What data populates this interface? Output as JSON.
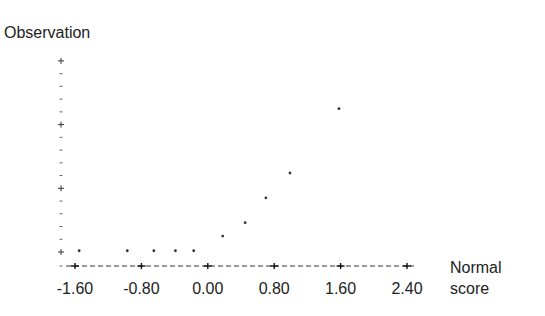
{
  "chart_data": {
    "type": "scatter",
    "title": "",
    "ylabel": "Observation",
    "xlabel": "Normal score",
    "xlabel_lines": [
      "Normal",
      "score"
    ],
    "x_ticks": [
      -1.6,
      -0.8,
      0.0,
      0.8,
      1.6,
      2.4
    ],
    "x_tick_labels": [
      "-1.60",
      "-0.80",
      "0.00",
      "0.80",
      "1.60",
      "2.40"
    ],
    "xlim": [
      -1.71,
      2.49
    ],
    "y_major_ticks": [
      0,
      1,
      2,
      3
    ],
    "y_minor_per_major": 4,
    "y_tick_labels": [],
    "ylim": [
      -0.2,
      3.05
    ],
    "grid": false,
    "legend": null,
    "points": [
      {
        "x": -1.55,
        "y": 0.02
      },
      {
        "x": -0.97,
        "y": 0.02
      },
      {
        "x": -0.65,
        "y": 0.02
      },
      {
        "x": -0.39,
        "y": 0.02
      },
      {
        "x": -0.17,
        "y": 0.02
      },
      {
        "x": 0.18,
        "y": 0.25
      },
      {
        "x": 0.45,
        "y": 0.46
      },
      {
        "x": 0.7,
        "y": 0.85
      },
      {
        "x": 0.99,
        "y": 1.24
      },
      {
        "x": 1.58,
        "y": 2.25
      }
    ],
    "colors": {
      "points": "#333333",
      "axis": "#333333",
      "text": "#222222"
    }
  }
}
